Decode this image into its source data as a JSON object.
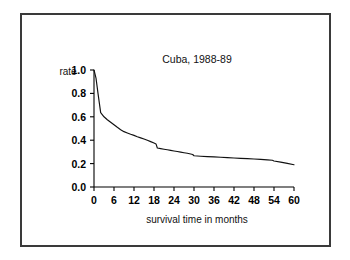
{
  "figure": {
    "border_color": "#3a3a3a",
    "background_color": "#ffffff"
  },
  "chart_data": {
    "type": "line",
    "title": "Cuba, 1988-89",
    "xlabel": "survival time in months",
    "ylabel": "rate",
    "ylabel_placement": "above-axis-left",
    "xlim": [
      0,
      60
    ],
    "ylim": [
      0.0,
      1.0
    ],
    "grid": false,
    "legend": false,
    "line_color": "#111111",
    "xticks": [
      0,
      6,
      12,
      18,
      24,
      30,
      36,
      42,
      48,
      54,
      60
    ],
    "xtick_labels": [
      "0",
      "6",
      "12",
      "18",
      "24",
      "30",
      "36",
      "42",
      "48",
      "54",
      "60"
    ],
    "yticks": [
      0.0,
      0.2,
      0.4,
      0.6,
      0.8,
      1.0
    ],
    "ytick_labels": [
      "0.0",
      "0.2",
      "0.4",
      "0.6",
      "0.8",
      "1.0"
    ],
    "series": [
      {
        "name": "survival rate",
        "x": [
          0,
          0.6,
          1.2,
          2,
          3,
          4,
          5,
          6,
          7,
          8,
          9,
          10,
          11,
          12,
          13,
          14,
          15,
          16,
          17,
          18,
          18.6,
          19,
          20,
          21,
          22,
          23,
          24,
          25,
          26,
          27,
          28,
          29,
          29.6,
          30,
          32,
          34,
          36,
          38,
          40,
          42,
          44,
          46,
          48,
          50,
          52,
          53.5,
          54,
          56,
          58,
          60
        ],
        "y": [
          1.0,
          0.93,
          0.8,
          0.635,
          0.6,
          0.575,
          0.553,
          0.532,
          0.51,
          0.49,
          0.473,
          0.462,
          0.451,
          0.441,
          0.43,
          0.42,
          0.41,
          0.399,
          0.388,
          0.376,
          0.368,
          0.333,
          0.328,
          0.323,
          0.318,
          0.313,
          0.308,
          0.303,
          0.298,
          0.293,
          0.288,
          0.282,
          0.278,
          0.267,
          0.263,
          0.26,
          0.257,
          0.254,
          0.251,
          0.248,
          0.245,
          0.242,
          0.239,
          0.236,
          0.232,
          0.229,
          0.222,
          0.213,
          0.202,
          0.19
        ]
      }
    ]
  }
}
